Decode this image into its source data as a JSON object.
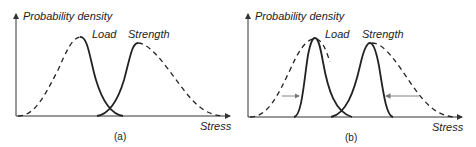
{
  "panels": [
    {
      "caption": "(a)",
      "y_axis_label": "Probability density",
      "x_axis_label": "Stress",
      "curve_labels": {
        "load": "Load",
        "strength": "Strength"
      }
    },
    {
      "caption": "(b)",
      "y_axis_label": "Probability density",
      "x_axis_label": "Stress",
      "curve_labels": {
        "load": "Load",
        "strength": "Strength"
      }
    }
  ],
  "colors": {
    "curve": "#222222",
    "axis": "#333333",
    "arrow": "#777777"
  }
}
